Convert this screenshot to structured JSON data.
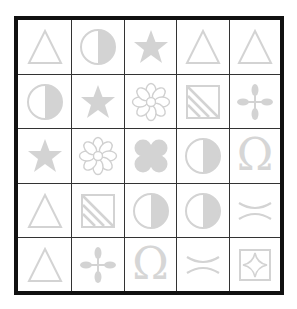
{
  "puzzle": {
    "rows": 5,
    "cols": 5,
    "symbol_color": "#d3d3d3",
    "grid_line_color": "#333333",
    "border_color": "#111111",
    "cells": [
      [
        "triangle-outline",
        "half-circle",
        "star",
        "triangle-outline",
        "triangle-outline"
      ],
      [
        "half-circle",
        "star",
        "flower-outline",
        "striped-square",
        "four-petal-cross"
      ],
      [
        "star",
        "flower-outline",
        "quatrefoil",
        "half-circle",
        "omega"
      ],
      [
        "triangle-outline",
        "striped-square",
        "half-circle",
        "half-circle",
        "facing-arcs"
      ],
      [
        "triangle-outline",
        "four-petal-cross",
        "omega",
        "facing-arcs",
        "diamond-in-square"
      ]
    ],
    "omega_glyph": "Ω"
  }
}
